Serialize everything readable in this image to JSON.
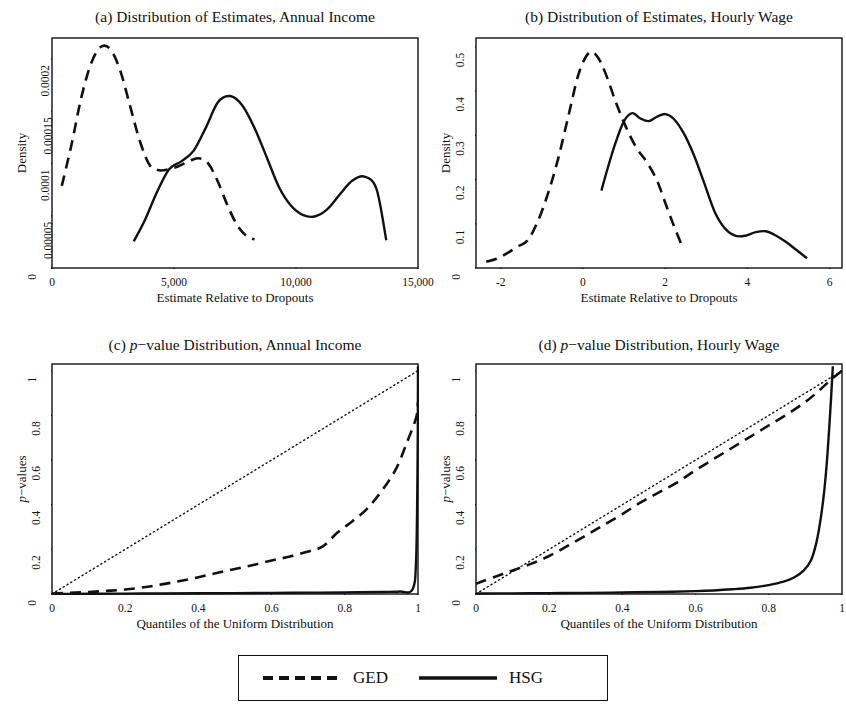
{
  "figure": {
    "background": "#ffffff",
    "ink": "#111111",
    "panel_count": 4
  },
  "legend": {
    "items": [
      {
        "label": "GED",
        "style": "dashed",
        "color": "#111111"
      },
      {
        "label": "HSG",
        "style": "solid",
        "color": "#111111"
      }
    ]
  },
  "chart_data": [
    {
      "id": "panel-a",
      "type": "line",
      "title": "(a) Distribution of Estimates, Annual Income",
      "xlabel": "Estimate Relative to Dropouts",
      "ylabel": "Density",
      "xlim": [
        0,
        15000
      ],
      "ylim": [
        0,
        0.00022
      ],
      "xticks": [
        0,
        5000,
        10000,
        15000
      ],
      "xticklabels": [
        "0",
        "5,000",
        "10,000",
        "15,000"
      ],
      "yticks": [
        0,
        5e-05,
        0.0001,
        0.00015,
        0.0002
      ],
      "yticklabels": [
        "0",
        "0.00005",
        "0.0001",
        "0.00015",
        "0.0002"
      ],
      "grid": false,
      "legend_position": "below-figure",
      "series": [
        {
          "name": "GED",
          "style": "dashed",
          "x": [
            400,
            800,
            1200,
            1600,
            2000,
            2400,
            2800,
            3200,
            3600,
            4000,
            4400,
            4800,
            5200,
            5600,
            6000,
            6400,
            6800,
            7200,
            7600,
            8000,
            8300
          ],
          "y": [
            7.85e-05,
            0.000118,
            0.000163,
            0.0001955,
            0.0002115,
            0.000209,
            0.0001885,
            0.000155,
            0.0001215,
            9.85e-05,
            9.35e-05,
            9.45e-05,
            9.75e-05,
            0.000102,
            0.000105,
            0.0001,
            8.25e-05,
            5.95e-05,
            4.05e-05,
            3e-05,
            2.75e-05
          ]
        },
        {
          "name": "HSG",
          "style": "solid",
          "x": [
            3350,
            3800,
            4300,
            4800,
            5300,
            5800,
            6300,
            6800,
            7300,
            7800,
            8300,
            8800,
            9300,
            9800,
            10300,
            10800,
            11300,
            11800,
            12300,
            12800,
            13300,
            13700
          ],
          "y": [
            2.55e-05,
            4.55e-05,
            7.25e-05,
            9.45e-05,
            0.000102,
            0.000112,
            0.000134,
            0.0001585,
            0.0001645,
            0.0001555,
            0.000134,
            0.000106,
            7.75e-05,
            5.95e-05,
            5.05e-05,
            4.95e-05,
            5.65e-05,
            7.05e-05,
            8.35e-05,
            8.75e-05,
            7.55e-05,
            2.65e-05
          ]
        }
      ]
    },
    {
      "id": "panel-b",
      "type": "line",
      "title": "(b) Distribution of Estimates, Hourly Wage",
      "xlabel": "Estimate Relative to Dropouts",
      "ylabel": "Density",
      "xlim": [
        -2.6,
        6.3
      ],
      "ylim": [
        0,
        0.52
      ],
      "xticks": [
        -2,
        0,
        2,
        4,
        6
      ],
      "xticklabels": [
        "-2",
        "0",
        "2",
        "4",
        "6"
      ],
      "yticks": [
        0,
        0.1,
        0.2,
        0.3,
        0.4,
        0.5
      ],
      "yticklabels": [
        "0",
        "0.1",
        "0.2",
        "0.3",
        "0.4",
        "0.5"
      ],
      "grid": false,
      "legend_position": "below-figure",
      "series": [
        {
          "name": "GED",
          "style": "dashed",
          "x": [
            -2.35,
            -2.1,
            -1.85,
            -1.6,
            -1.35,
            -1.1,
            -0.85,
            -0.6,
            -0.35,
            -0.1,
            0.15,
            0.35,
            0.55,
            0.8,
            1.05,
            1.3,
            1.55,
            1.8,
            2.0,
            2.2,
            2.4
          ],
          "y": [
            0.014,
            0.021,
            0.033,
            0.048,
            0.062,
            0.105,
            0.168,
            0.248,
            0.345,
            0.44,
            0.487,
            0.478,
            0.44,
            0.375,
            0.318,
            0.272,
            0.24,
            0.198,
            0.148,
            0.098,
            0.052
          ]
        },
        {
          "name": "HSG",
          "style": "solid",
          "x": [
            0.45,
            0.6,
            0.8,
            1.0,
            1.2,
            1.4,
            1.6,
            1.8,
            2.0,
            2.2,
            2.45,
            2.7,
            2.95,
            3.2,
            3.45,
            3.7,
            3.95,
            4.2,
            4.45,
            4.7,
            4.95,
            5.2,
            5.45
          ],
          "y": [
            0.175,
            0.225,
            0.285,
            0.332,
            0.35,
            0.338,
            0.332,
            0.342,
            0.348,
            0.338,
            0.305,
            0.255,
            0.192,
            0.128,
            0.09,
            0.073,
            0.073,
            0.081,
            0.083,
            0.073,
            0.058,
            0.04,
            0.022
          ]
        }
      ]
    },
    {
      "id": "panel-c",
      "type": "line",
      "title": "(c) p−value Distribution, Annual Income",
      "title_parts": {
        "prefix": "(c) ",
        "italic": "p",
        "suffix": "−value Distribution, Annual Income"
      },
      "xlabel": "Quantiles of the Uniform Distribution",
      "ylabel": "p−values",
      "ylabel_parts": {
        "italic": "p",
        "suffix": "−values"
      },
      "xlim": [
        0,
        1
      ],
      "ylim": [
        0,
        1.03
      ],
      "xticks": [
        0,
        0.2,
        0.4,
        0.6,
        0.8,
        1
      ],
      "xticklabels": [
        "0",
        "0.2",
        "0.4",
        "0.6",
        "0.8",
        "1"
      ],
      "yticks": [
        0,
        0.2,
        0.4,
        0.6,
        0.8,
        1
      ],
      "yticklabels": [
        "0",
        "0.2",
        "0.4",
        "0.6",
        "0.8",
        "1"
      ],
      "grid": false,
      "legend_position": "below-figure",
      "reference_line": {
        "name": "45-degree",
        "style": "dotted",
        "from": [
          0,
          0
        ],
        "to": [
          1,
          1
        ]
      },
      "series": [
        {
          "name": "GED",
          "style": "dashed",
          "x": [
            0.0,
            0.05,
            0.1,
            0.15,
            0.2,
            0.25,
            0.3,
            0.35,
            0.4,
            0.45,
            0.5,
            0.55,
            0.6,
            0.65,
            0.7,
            0.74,
            0.78,
            0.82,
            0.86,
            0.9,
            0.94,
            0.97,
            0.995,
            1.0
          ],
          "y": [
            0.002,
            0.005,
            0.009,
            0.014,
            0.02,
            0.03,
            0.043,
            0.058,
            0.075,
            0.094,
            0.112,
            0.13,
            0.15,
            0.168,
            0.19,
            0.213,
            0.275,
            0.325,
            0.38,
            0.46,
            0.56,
            0.68,
            0.79,
            0.86
          ]
        },
        {
          "name": "HSG",
          "style": "solid",
          "x": [
            0.0,
            0.1,
            0.2,
            0.3,
            0.4,
            0.5,
            0.6,
            0.7,
            0.8,
            0.9,
            0.95,
            0.985,
            0.995,
            0.999,
            1.0
          ],
          "y": [
            0.0,
            0.0008,
            0.0016,
            0.0024,
            0.0032,
            0.004,
            0.005,
            0.006,
            0.007,
            0.009,
            0.011,
            0.02,
            0.16,
            0.62,
            1.02
          ]
        }
      ]
    },
    {
      "id": "panel-d",
      "type": "line",
      "title": "(d) p−value Distribution, Hourly Wage",
      "title_parts": {
        "prefix": "(d) ",
        "italic": "p",
        "suffix": "−value Distribution, Hourly Wage"
      },
      "xlabel": "Quantiles of the Uniform Distribution",
      "ylabel": "p−values",
      "ylabel_parts": {
        "italic": "p",
        "suffix": "−values"
      },
      "xlim": [
        0,
        1
      ],
      "ylim": [
        0,
        1.03
      ],
      "xticks": [
        0,
        0.2,
        0.4,
        0.6,
        0.8,
        1
      ],
      "xticklabels": [
        "0",
        "0.2",
        "0.4",
        "0.6",
        "0.8",
        "1"
      ],
      "yticks": [
        0,
        0.2,
        0.4,
        0.6,
        0.8,
        1
      ],
      "yticklabels": [
        "0",
        "0.2",
        "0.4",
        "0.6",
        "0.8",
        "1"
      ],
      "grid": false,
      "legend_position": "below-figure",
      "reference_line": {
        "name": "45-degree",
        "style": "dotted",
        "from": [
          0,
          0
        ],
        "to": [
          1,
          1
        ]
      },
      "series": [
        {
          "name": "GED",
          "style": "dashed",
          "x": [
            0.0,
            0.02,
            0.06,
            0.1,
            0.15,
            0.2,
            0.25,
            0.3,
            0.35,
            0.4,
            0.45,
            0.5,
            0.55,
            0.6,
            0.65,
            0.7,
            0.75,
            0.8,
            0.85,
            0.9,
            0.94,
            0.97,
            1.0
          ],
          "y": [
            0.045,
            0.058,
            0.082,
            0.105,
            0.135,
            0.17,
            0.215,
            0.262,
            0.31,
            0.358,
            0.41,
            0.455,
            0.5,
            0.555,
            0.605,
            0.655,
            0.705,
            0.755,
            0.805,
            0.86,
            0.915,
            0.96,
            1.0
          ]
        },
        {
          "name": "HSG",
          "style": "solid",
          "x": [
            0.0,
            0.1,
            0.2,
            0.3,
            0.4,
            0.5,
            0.6,
            0.65,
            0.7,
            0.75,
            0.8,
            0.84,
            0.87,
            0.895,
            0.915,
            0.93,
            0.942,
            0.952,
            0.96,
            0.968,
            0.975
          ],
          "y": [
            0.002,
            0.003,
            0.004,
            0.005,
            0.007,
            0.009,
            0.013,
            0.016,
            0.021,
            0.028,
            0.04,
            0.055,
            0.075,
            0.105,
            0.15,
            0.23,
            0.34,
            0.47,
            0.62,
            0.82,
            1.02
          ]
        }
      ]
    }
  ]
}
